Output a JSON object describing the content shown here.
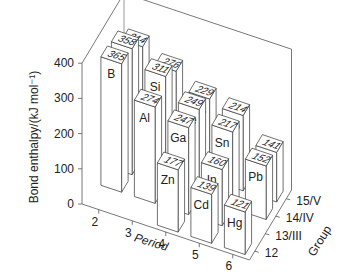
{
  "chart_data": {
    "type": "bar3d",
    "title": "",
    "xlabel": "Period",
    "ylabel": "Group",
    "zlabel": "Bond enthalpy/(kJ mol⁻¹)",
    "zlim": [
      0,
      400
    ],
    "z_ticks": [
      0,
      100,
      200,
      300,
      400
    ],
    "periods": [
      "2",
      "3",
      "4",
      "5",
      "6"
    ],
    "groups": [
      "12",
      "13/III",
      "14/IV",
      "15/V"
    ],
    "bars": [
      {
        "element": "B",
        "period": "2",
        "group": "13/III",
        "value": 365
      },
      {
        "element": "C",
        "period": "2",
        "group": "14/IV",
        "value": 358
      },
      {
        "element": "N",
        "period": "2",
        "group": "15/V",
        "value": 314
      },
      {
        "element": "Al",
        "period": "3",
        "group": "13/III",
        "value": 274
      },
      {
        "element": "Si",
        "period": "3",
        "group": "14/IV",
        "value": 311
      },
      {
        "element": "P",
        "period": "3",
        "group": "15/V",
        "value": 276
      },
      {
        "element": "Zn",
        "period": "4",
        "group": "12",
        "value": 177
      },
      {
        "element": "Ga",
        "period": "4",
        "group": "13/III",
        "value": 247
      },
      {
        "element": "Ge",
        "period": "4",
        "group": "14/IV",
        "value": 249
      },
      {
        "element": "As",
        "period": "4",
        "group": "15/V",
        "value": 229
      },
      {
        "element": "Cd",
        "period": "5",
        "group": "12",
        "value": 139
      },
      {
        "element": "In",
        "period": "5",
        "group": "13/III",
        "value": 160
      },
      {
        "element": "Sn",
        "period": "5",
        "group": "14/IV",
        "value": 217
      },
      {
        "element": "Sb",
        "period": "5",
        "group": "15/V",
        "value": 214
      },
      {
        "element": "Hg",
        "period": "6",
        "group": "12",
        "value": 121
      },
      {
        "element": "Pb",
        "period": "6",
        "group": "14/IV",
        "value": 152
      },
      {
        "element": "Bi",
        "period": "6",
        "group": "15/V",
        "value": 141
      }
    ],
    "grid": false,
    "legend": null
  },
  "colors": {
    "bar_fill": "#ffffff",
    "bar_stroke": "#333333",
    "axis": "#555555"
  }
}
